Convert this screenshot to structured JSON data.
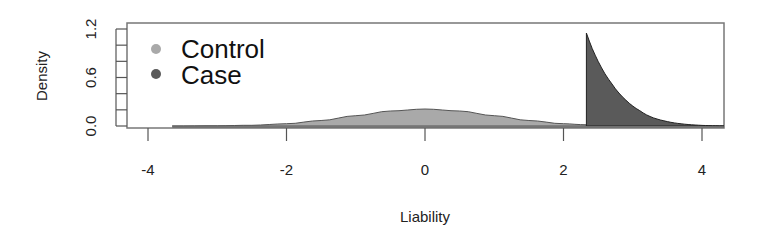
{
  "chart_data": {
    "type": "area",
    "title": "",
    "xlabel": "Liability",
    "ylabel": "Density",
    "xlim": [
      -4.3,
      4.3
    ],
    "ylim": [
      0.0,
      1.2
    ],
    "x_ticks": [
      -4,
      -2,
      0,
      2,
      4
    ],
    "x_tick_labels": [
      "-4",
      "-2",
      "0",
      "2",
      "4"
    ],
    "y_ticks": [
      0.0,
      0.2,
      0.4,
      0.6,
      0.8,
      1.0,
      1.2
    ],
    "y_tick_labels": [
      "0.0",
      "",
      "",
      "0.6",
      "",
      "",
      "1.2"
    ],
    "grid": false,
    "legend_position": "top-left",
    "threshold": 2.33,
    "series": [
      {
        "name": "Control",
        "color": "#a9a9a9",
        "x": [
          -3.65,
          -3.0,
          -2.5,
          -2.0,
          -1.5,
          -1.0,
          -0.5,
          0.0,
          0.5,
          1.0,
          1.5,
          2.0,
          2.33
        ],
        "values": [
          0.0,
          0.003,
          0.009,
          0.028,
          0.068,
          0.127,
          0.185,
          0.21,
          0.185,
          0.127,
          0.068,
          0.028,
          0.015
        ]
      },
      {
        "name": "Case",
        "color": "#5a5a5a",
        "x": [
          2.33,
          2.5,
          2.7,
          2.9,
          3.1,
          3.3,
          3.5,
          3.7,
          3.9,
          4.1,
          4.3
        ],
        "values": [
          1.15,
          0.8,
          0.52,
          0.32,
          0.19,
          0.1,
          0.055,
          0.027,
          0.012,
          0.005,
          0.002
        ]
      }
    ]
  },
  "legend": {
    "items": [
      {
        "label": "Control",
        "color": "#a9a9a9"
      },
      {
        "label": "Case",
        "color": "#5a5a5a"
      }
    ]
  },
  "axes": {
    "xlabel": "Liability",
    "ylabel": "Density"
  }
}
